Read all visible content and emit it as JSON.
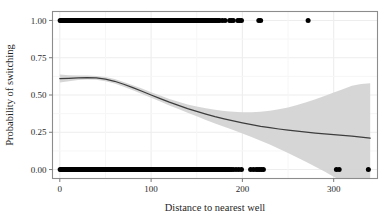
{
  "figure": {
    "background_color": "#ffffff",
    "panel": {
      "background_color": "#ffffff",
      "border_color": "#8c8c8c",
      "grid_color": "#ededed"
    }
  },
  "chart_data": {
    "type": "scatter",
    "title": "",
    "subtitle": "",
    "xlabel": "Distance to nearest well",
    "ylabel": "Probability of switching",
    "xlim": [
      -8,
      348
    ],
    "ylim": [
      -0.06,
      1.06
    ],
    "xticks": [
      0,
      100,
      200,
      300
    ],
    "xticklabels": [
      "0",
      "100",
      "200",
      "300"
    ],
    "yticks": [
      0.0,
      0.25,
      0.5,
      0.75,
      1.0
    ],
    "yticklabels": [
      "0.00",
      "0.25",
      "0.50",
      "0.75",
      "1.00"
    ],
    "grid": true,
    "legend": null,
    "legend_position": "none",
    "point_color": "#000000",
    "line_color": "#3d3d3d",
    "band_color": "#d4d4d4",
    "series": [
      {
        "name": "observations_switched",
        "type": "scatter",
        "y_value": 1.0,
        "x": [
          0.4,
          1.5,
          2.3,
          3.1,
          4.0,
          4.8,
          5.6,
          6.4,
          7.2,
          8.0,
          8.8,
          9.6,
          10.4,
          11.2,
          12.0,
          12.8,
          13.6,
          14.4,
          15.2,
          16.0,
          16.8,
          17.6,
          18.4,
          19.2,
          20.0,
          20.8,
          21.6,
          22.4,
          23.2,
          24.0,
          24.8,
          25.6,
          26.4,
          27.2,
          28.0,
          28.8,
          29.6,
          30.4,
          31.2,
          32.0,
          32.8,
          33.6,
          34.4,
          35.2,
          36.0,
          36.8,
          37.6,
          38.4,
          39.2,
          40.0,
          40.8,
          41.6,
          42.4,
          43.2,
          44.0,
          44.8,
          45.6,
          46.4,
          47.2,
          48.0,
          48.8,
          49.6,
          50.4,
          51.2,
          52.0,
          52.8,
          53.6,
          54.4,
          55.2,
          56.0,
          56.8,
          57.6,
          58.4,
          59.2,
          60.0,
          60.8,
          61.6,
          62.4,
          63.2,
          64.0,
          64.8,
          65.6,
          66.4,
          67.2,
          68.0,
          68.8,
          69.6,
          70.4,
          71.2,
          72.0,
          72.8,
          73.6,
          74.4,
          75.2,
          76.0,
          76.8,
          77.6,
          78.4,
          79.2,
          80.0,
          80.8,
          81.6,
          82.4,
          83.2,
          84.0,
          84.8,
          85.6,
          86.4,
          87.2,
          88.0,
          88.8,
          89.6,
          90.4,
          91.2,
          92.0,
          92.8,
          93.6,
          94.4,
          95.2,
          96.0,
          96.8,
          97.6,
          98.4,
          99.2,
          100.0,
          100.8,
          101.6,
          102.4,
          103.2,
          104.0,
          104.8,
          105.6,
          106.4,
          107.2,
          108.0,
          108.8,
          109.6,
          110.4,
          111.2,
          112.0,
          112.8,
          113.6,
          114.4,
          115.2,
          116.0,
          116.8,
          117.6,
          118.4,
          119.2,
          120.0,
          120.8,
          121.6,
          122.4,
          123.2,
          124.0,
          124.8,
          125.6,
          126.4,
          127.2,
          128.0,
          128.8,
          129.6,
          130.4,
          131.2,
          132.0,
          132.8,
          133.6,
          134.4,
          135.2,
          136.0,
          136.8,
          137.6,
          138.4,
          139.2,
          140.0,
          140.8,
          141.6,
          142.4,
          143.2,
          144.0,
          144.8,
          145.6,
          146.4,
          147.2,
          148.0,
          148.8,
          149.6,
          150.4,
          151.2,
          152.0,
          152.8,
          153.6,
          154.4,
          155.2,
          156.0,
          156.8,
          157.6,
          158.4,
          159.2,
          160.0,
          161.5,
          163.0,
          164.5,
          166.0,
          167.5,
          169.0,
          170.5,
          172.0,
          173.5,
          175.0,
          178.0,
          181.0,
          186.0,
          188.0,
          190.0,
          195.0,
          197.0,
          199.0,
          218.0,
          220.0,
          272.0
        ],
        "count": 214
      },
      {
        "name": "observations_not_switched",
        "type": "scatter",
        "y_value": 0.0,
        "x": [
          0.4,
          1.4,
          2.2,
          3.0,
          3.8,
          4.6,
          5.4,
          6.2,
          7.0,
          7.8,
          8.6,
          9.4,
          10.2,
          11.0,
          11.8,
          12.6,
          13.4,
          14.2,
          15.0,
          15.8,
          16.6,
          17.4,
          18.2,
          19.0,
          19.8,
          20.6,
          21.4,
          22.2,
          23.0,
          23.8,
          24.6,
          25.4,
          26.2,
          27.0,
          27.8,
          28.6,
          29.4,
          30.2,
          31.0,
          31.8,
          32.6,
          33.4,
          34.2,
          35.0,
          35.8,
          36.6,
          37.4,
          38.2,
          39.0,
          39.8,
          40.6,
          41.4,
          42.2,
          43.0,
          43.8,
          44.6,
          45.4,
          46.2,
          47.0,
          47.8,
          48.6,
          49.4,
          50.2,
          51.0,
          51.8,
          52.6,
          53.4,
          54.2,
          55.0,
          55.8,
          56.6,
          57.4,
          58.2,
          59.0,
          59.8,
          60.6,
          61.4,
          62.2,
          63.0,
          63.8,
          64.6,
          65.4,
          66.2,
          67.0,
          67.8,
          68.6,
          69.4,
          70.2,
          71.0,
          71.8,
          72.6,
          73.4,
          74.2,
          75.0,
          75.8,
          76.6,
          77.4,
          78.2,
          79.0,
          79.8,
          80.6,
          81.4,
          82.2,
          83.0,
          83.8,
          84.6,
          85.4,
          86.2,
          87.0,
          87.8,
          88.6,
          89.4,
          90.2,
          91.0,
          91.8,
          92.6,
          93.4,
          94.2,
          95.0,
          95.8,
          96.6,
          97.4,
          98.2,
          99.0,
          99.8,
          100.6,
          101.4,
          102.2,
          103.0,
          103.8,
          104.6,
          105.4,
          106.2,
          107.0,
          107.8,
          108.6,
          109.4,
          110.2,
          111.0,
          111.8,
          112.6,
          113.4,
          114.2,
          115.0,
          115.8,
          116.6,
          117.4,
          118.2,
          119.0,
          119.8,
          120.6,
          121.4,
          122.2,
          123.0,
          123.8,
          124.6,
          125.4,
          126.2,
          127.0,
          127.8,
          128.6,
          129.4,
          130.2,
          131.0,
          131.8,
          132.6,
          133.4,
          134.2,
          135.0,
          135.8,
          136.6,
          137.4,
          138.2,
          139.0,
          139.8,
          140.6,
          141.4,
          142.2,
          143.0,
          143.8,
          144.6,
          145.4,
          146.2,
          147.0,
          147.8,
          148.6,
          149.4,
          150.2,
          151.0,
          151.8,
          152.6,
          153.4,
          154.2,
          155.0,
          155.8,
          156.6,
          157.4,
          158.2,
          159.0,
          159.8,
          160.6,
          161.4,
          162.2,
          163.0,
          163.8,
          164.6,
          165.4,
          166.2,
          167.0,
          167.8,
          168.6,
          169.4,
          170.2,
          171.0,
          171.8,
          172.6,
          173.4,
          174.2,
          175.0,
          176.0,
          177.0,
          178.0,
          179.0,
          180.0,
          181.0,
          182.0,
          183.0,
          184.0,
          185.0,
          186.0,
          188.0,
          190.0,
          193.0,
          196.0,
          199.0,
          209.0,
          212.0,
          215.0,
          217.0,
          219.0,
          221.0,
          223.0,
          303.0,
          306.0,
          338.0
        ],
        "count": 246
      },
      {
        "name": "loess_fit",
        "type": "line",
        "x": [
          0,
          10,
          20,
          30,
          40,
          50,
          60,
          70,
          80,
          90,
          100,
          110,
          120,
          130,
          140,
          150,
          160,
          170,
          180,
          190,
          200,
          210,
          220,
          230,
          240,
          250,
          260,
          270,
          280,
          290,
          300,
          310,
          320,
          330,
          340
        ],
        "y": [
          0.61,
          0.612,
          0.615,
          0.617,
          0.615,
          0.607,
          0.592,
          0.572,
          0.549,
          0.525,
          0.5,
          0.476,
          0.452,
          0.43,
          0.409,
          0.39,
          0.372,
          0.355,
          0.34,
          0.326,
          0.313,
          0.301,
          0.29,
          0.281,
          0.272,
          0.264,
          0.257,
          0.251,
          0.245,
          0.24,
          0.234,
          0.229,
          0.224,
          0.218,
          0.211
        ]
      },
      {
        "name": "loess_confidence_band",
        "type": "area",
        "x": [
          0,
          10,
          20,
          30,
          40,
          50,
          60,
          70,
          80,
          90,
          100,
          110,
          120,
          130,
          140,
          150,
          160,
          170,
          180,
          190,
          200,
          210,
          220,
          230,
          240,
          250,
          260,
          270,
          280,
          290,
          300,
          310,
          320,
          330,
          340
        ],
        "y_upper": [
          0.637,
          0.632,
          0.63,
          0.63,
          0.628,
          0.621,
          0.607,
          0.588,
          0.566,
          0.543,
          0.519,
          0.496,
          0.474,
          0.454,
          0.437,
          0.423,
          0.411,
          0.401,
          0.393,
          0.387,
          0.384,
          0.384,
          0.387,
          0.394,
          0.404,
          0.417,
          0.433,
          0.451,
          0.471,
          0.493,
          0.516,
          0.539,
          0.562,
          0.573,
          0.578
        ],
        "y_lower": [
          0.583,
          0.592,
          0.6,
          0.604,
          0.602,
          0.593,
          0.577,
          0.556,
          0.532,
          0.507,
          0.481,
          0.456,
          0.43,
          0.406,
          0.381,
          0.357,
          0.333,
          0.309,
          0.287,
          0.265,
          0.242,
          0.218,
          0.193,
          0.168,
          0.14,
          0.111,
          0.081,
          0.051,
          0.019,
          -0.013,
          -0.048,
          -0.081,
          -0.114,
          -0.14,
          -0.156
        ]
      }
    ]
  }
}
